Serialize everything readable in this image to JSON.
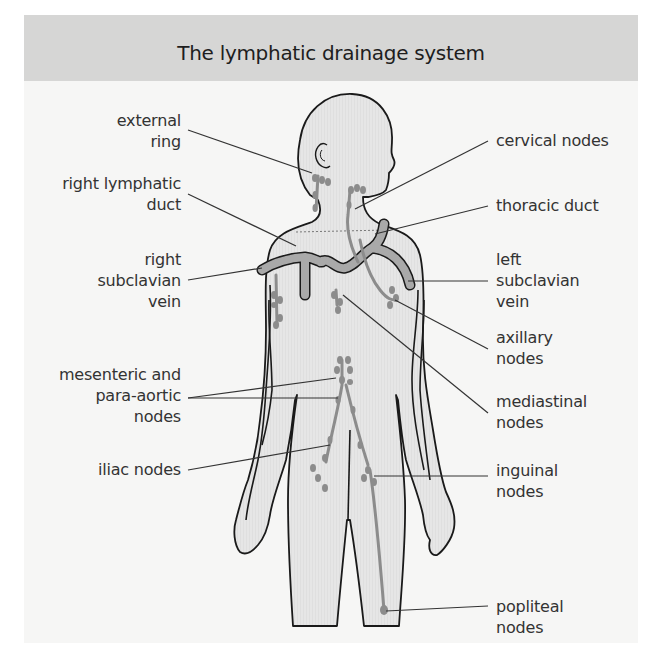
{
  "header": {
    "title": "The lymphatic drainage system"
  },
  "labels": {
    "left": [
      {
        "id": "external-ring",
        "text": "external\nring"
      },
      {
        "id": "right-lymphatic-duct",
        "text": "right lymphatic\nduct"
      },
      {
        "id": "right-subclavian-vein",
        "text": "right\nsubclavian\nvein"
      },
      {
        "id": "mesenteric-para-aortic-nodes",
        "text": "mesenteric and\npara-aortic\nnodes"
      },
      {
        "id": "iliac-nodes",
        "text": "iliac nodes"
      }
    ],
    "right": [
      {
        "id": "cervical-nodes",
        "text": "cervical nodes"
      },
      {
        "id": "thoracic-duct",
        "text": "thoracic duct"
      },
      {
        "id": "left-subclavian-vein",
        "text": "left\nsubclavian\nvein"
      },
      {
        "id": "axillary-nodes",
        "text": "axillary\nnodes"
      },
      {
        "id": "mediastinal-nodes",
        "text": "mediastinal\nnodes"
      },
      {
        "id": "inguinal-nodes",
        "text": "inguinal\nnodes"
      },
      {
        "id": "popliteal-nodes",
        "text": "popliteal\nnodes"
      }
    ]
  },
  "colors": {
    "header_bg": "#d6d6d5",
    "panel_bg": "#f6f6f5",
    "body_fill": "#e4e4e4",
    "outline": "#1a1a1a",
    "lymph": "#8c8c8c",
    "vein": "#a9a9a9",
    "text": "#333333"
  }
}
